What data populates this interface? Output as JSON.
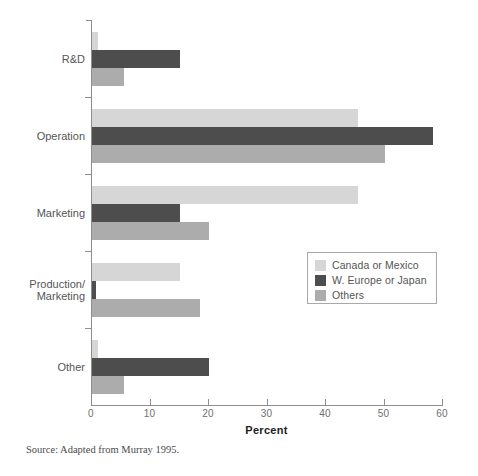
{
  "chart_data": {
    "type": "bar",
    "orientation": "horizontal",
    "title": "",
    "xlabel": "Percent",
    "ylabel": "",
    "xlim": [
      0,
      60
    ],
    "xticks": [
      0,
      10,
      20,
      30,
      40,
      50,
      60
    ],
    "xtick_labels": [
      "0",
      "10",
      "20",
      "30",
      "40",
      "50",
      "60"
    ],
    "grid": false,
    "legend_position": "center-right",
    "categories": [
      "R&D",
      "Operation",
      "Marketing",
      "Production/\nMarketing",
      "Other"
    ],
    "category_labels": [
      [
        "R&D"
      ],
      [
        "Operation"
      ],
      [
        "Marketing"
      ],
      [
        "Production/",
        "Marketing"
      ],
      [
        "Other"
      ]
    ],
    "series": [
      {
        "name": "Canada or Mexico",
        "color": "#d6d6d6",
        "values": [
          1,
          45.5,
          45.5,
          15,
          1
        ]
      },
      {
        "name": "W. Europe or Japan",
        "color": "#4d4d4d",
        "values": [
          15,
          58.3,
          15,
          0.7,
          20
        ]
      },
      {
        "name": "Others",
        "color": "#acacac",
        "values": [
          5.5,
          50,
          20,
          18.5,
          5.5
        ]
      }
    ],
    "source_note": "Source: Adapted from Murray 1995."
  },
  "legend": {
    "items": [
      {
        "label": "Canada or Mexico"
      },
      {
        "label": "W. Europe or Japan"
      },
      {
        "label": "Others"
      }
    ]
  }
}
